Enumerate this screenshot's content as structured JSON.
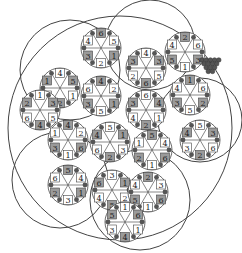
{
  "diagram": {
    "type": "hexagonal-flower-number-puzzle",
    "colors": {
      "background": "#ffffff",
      "line": "#444444",
      "grey_cell": "#9a9a9a",
      "dark_wedge": "#555555",
      "grapes": "#555555"
    },
    "outer_arcs": [
      {
        "cx": 120,
        "cy": 128,
        "r": 112
      },
      {
        "cx": 70,
        "cy": 70,
        "r": 50
      },
      {
        "cx": 150,
        "cy": 45,
        "r": 45
      },
      {
        "cx": 200,
        "cy": 120,
        "r": 42
      },
      {
        "cx": 60,
        "cy": 180,
        "r": 48
      },
      {
        "cx": 140,
        "cy": 200,
        "r": 50
      }
    ],
    "flowers": [
      {
        "id": "f1",
        "cx": 101,
        "cy": 48,
        "labels": [
          "6",
          "5",
          "1",
          "2",
          "3",
          "4"
        ]
      },
      {
        "id": "f2",
        "cx": 146,
        "cy": 68,
        "labels": [
          "4",
          "3",
          "5",
          "6",
          "2",
          "3"
        ]
      },
      {
        "id": "f3",
        "cx": 185,
        "cy": 52,
        "labels": [
          "2",
          "6",
          "3",
          "1",
          "5",
          "4"
        ]
      },
      {
        "id": "f4",
        "cx": 60,
        "cy": 88,
        "labels": [
          "4",
          "5",
          "1",
          "2",
          "6",
          "1"
        ]
      },
      {
        "id": "f5",
        "cx": 101,
        "cy": 96,
        "labels": [
          "4",
          "2",
          "1",
          "5",
          "3",
          "6"
        ]
      },
      {
        "id": "f6",
        "cx": 146,
        "cy": 110,
        "labels": [
          "6",
          "4",
          "1",
          "2",
          "4",
          "3"
        ]
      },
      {
        "id": "f7",
        "cx": 190,
        "cy": 95,
        "labels": [
          "1",
          "6",
          "2",
          "5",
          "3",
          "4"
        ]
      },
      {
        "id": "f8",
        "cx": 40,
        "cy": 110,
        "labels": [
          "1",
          "3",
          "5",
          "4",
          "6",
          "2"
        ]
      },
      {
        "id": "f9",
        "cx": 68,
        "cy": 140,
        "labels": [
          "4",
          "2",
          "6",
          "1",
          "3",
          "1"
        ]
      },
      {
        "id": "f10",
        "cx": 110,
        "cy": 142,
        "labels": [
          "5",
          "1",
          "3",
          "2",
          "6",
          "4"
        ]
      },
      {
        "id": "f11",
        "cx": 152,
        "cy": 150,
        "labels": [
          "5",
          "4",
          "6",
          "1",
          "2",
          "1"
        ]
      },
      {
        "id": "f12",
        "cx": 200,
        "cy": 140,
        "labels": [
          "5",
          "3",
          "6",
          "2",
          "3",
          "4"
        ]
      },
      {
        "id": "f13",
        "cx": 68,
        "cy": 185,
        "labels": [
          "5",
          "4",
          "1",
          "3",
          "2",
          "6"
        ]
      },
      {
        "id": "f14",
        "cx": 112,
        "cy": 190,
        "labels": [
          "3",
          "1",
          "2",
          "5",
          "4",
          "6"
        ]
      },
      {
        "id": "f15",
        "cx": 148,
        "cy": 192,
        "labels": [
          "2",
          "3",
          "6",
          "1",
          "5",
          "4"
        ]
      },
      {
        "id": "f16",
        "cx": 125,
        "cy": 222,
        "labels": [
          "1",
          "6",
          "1",
          "4",
          "3",
          "5"
        ]
      }
    ],
    "grapes": {
      "cx": 210,
      "cy": 66,
      "count": 14
    }
  }
}
